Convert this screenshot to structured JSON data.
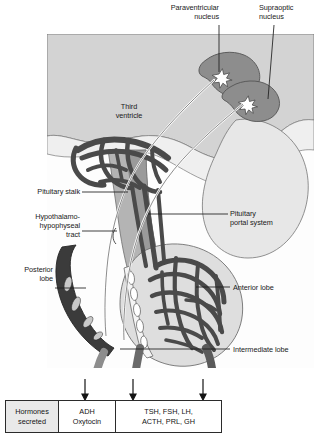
{
  "figure": {
    "type": "anatomical-diagram"
  },
  "labels": {
    "paraventricular_nucleus": "Paraventricular\nnucleus",
    "supraoptic_nucleus": "Supraoptic\nnucleus",
    "third_ventricle": "Third\nventricle",
    "pituitary_stalk": "Pituitary stalk",
    "hypothalamo_hypophyseal_tract": "Hypothalamo-\nhypophyseal\ntract",
    "posterior_lobe": "Posterior\nlobe",
    "pituitary_portal_system": "Pituitary\nportal system",
    "anterior_lobe": "Anterior lobe",
    "intermediate_lobe": "Intermediate lobe"
  },
  "table": {
    "row_header": "Hormones\nsecreted",
    "cells": [
      {
        "label": "ADH\nOxytocin"
      },
      {
        "label": "TSH, FSH, LH,\nACTH, PRL, GH"
      }
    ]
  },
  "colors": {
    "brain_fill": "#d2d2d2",
    "nucleus_fill": "#8e8e8e",
    "vessel_dark": "#4d4d4d",
    "posterior_lobe": "#3a3a3a",
    "anterior_lobe": "#dcdcdc",
    "stalk_fill": "#a8a8a8",
    "outline": "#4a4a4a",
    "table_header_bg": "#e9e9e9",
    "text": "#1a1a1a"
  }
}
